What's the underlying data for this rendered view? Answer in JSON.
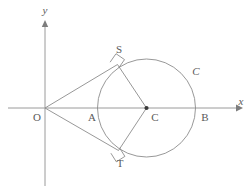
{
  "figure": {
    "width": 250,
    "height": 191,
    "background_color": "#ffffff",
    "stroke_color": "#8c8c8c",
    "label_color": "#5a5a5a"
  },
  "axes": {
    "x_axis_label": "x",
    "y_axis_label": "y",
    "origin_label": "O",
    "x_axis": {
      "x1": 8,
      "y1": 108,
      "x2": 236,
      "y2": 108
    },
    "y_axis": {
      "x1": 45,
      "y1": 186,
      "x2": 45,
      "y2": 21
    }
  },
  "circle": {
    "label": "C",
    "center_label": "C",
    "center_x": 146.5,
    "center_y": 108,
    "radius": 49
  },
  "points": [
    {
      "name": "O",
      "label": "O",
      "x": 45,
      "y": 108,
      "label_x": 38,
      "label_y": 120,
      "dot": false
    },
    {
      "name": "A",
      "label": "A",
      "x": 97.5,
      "y": 108,
      "label_x": 92,
      "label_y": 120,
      "dot": false
    },
    {
      "name": "C",
      "label": "C",
      "x": 146.5,
      "y": 108,
      "label_x": 152,
      "label_y": 120,
      "dot": true
    },
    {
      "name": "B",
      "label": "B",
      "x": 195.5,
      "y": 108,
      "label_x": 202,
      "label_y": 120,
      "dot": false
    },
    {
      "name": "S",
      "label": "S",
      "x": 117.5,
      "y": 64.5,
      "label_x": 115,
      "label_y": 53,
      "dot": false
    },
    {
      "name": "T",
      "label": "T",
      "x": 118.5,
      "y": 150.5,
      "label_x": 116,
      "label_y": 166,
      "dot": false
    }
  ],
  "segments": [
    {
      "name": "tangent-O-to-S",
      "x1": 45,
      "y1": 108,
      "x2": 117.5,
      "y2": 64.5
    },
    {
      "name": "tangent-O-to-T",
      "x1": 45,
      "y1": 108,
      "x2": 118.5,
      "y2": 150.5
    },
    {
      "name": "radius-C-to-S",
      "x1": 146.5,
      "y1": 108,
      "x2": 117.5,
      "y2": 64.5
    },
    {
      "name": "radius-C-to-T",
      "x1": 146.5,
      "y1": 108,
      "x2": 118.5,
      "y2": 150.5
    }
  ],
  "right_angle_marks": [
    {
      "name": "right-angle-at-S",
      "vertex_x": 117.5,
      "vertex_y": 64.5,
      "size": 9
    },
    {
      "name": "right-angle-at-T",
      "vertex_x": 118.5,
      "vertex_y": 150.5,
      "size": 9
    }
  ],
  "circle_label_position": {
    "x": 193,
    "y": 74
  },
  "y_label_position": {
    "x": 42,
    "y": 12
  },
  "x_label_position": {
    "x": 239,
    "y": 105
  }
}
